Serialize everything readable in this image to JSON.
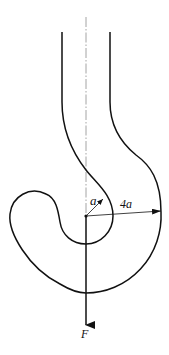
{
  "diagram": {
    "labels": {
      "inner_radius": "a",
      "outer_radius": "4a",
      "force": "F"
    },
    "colors": {
      "stroke": "#111111",
      "centerline": "#9a9a9a",
      "background": "#ffffff"
    }
  }
}
